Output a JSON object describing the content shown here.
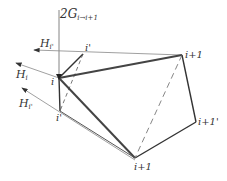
{
  "diagram": {
    "labels": {
      "top": "2G",
      "top_sub": "i→i+1",
      "h_i_prime_top": "H",
      "h_i_prime_top_sub": "i'",
      "h_i": "H",
      "h_i_sub": "i",
      "h_i_prime_bottom": "H",
      "h_i_prime_bottom_sub": "i'",
      "node_i": "i",
      "node_i_prime_top": "i'",
      "node_i_prime_bottom": "i'",
      "node_i_plus_1_top": "i+1",
      "node_i_plus_1_prime": "i+1'",
      "node_i_plus_1_bottom": "i+1"
    },
    "colors": {
      "stroke": "#333333",
      "thin": "#777777"
    }
  }
}
